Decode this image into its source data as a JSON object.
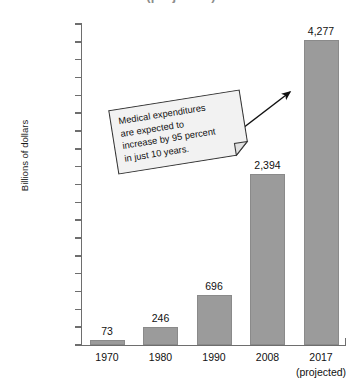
{
  "chart_data": {
    "type": "bar",
    "title": "(projected)",
    "xlabel": "",
    "ylabel": "Billions of dollars",
    "categories": [
      "1970",
      "1980",
      "1990",
      "2008",
      "2017"
    ],
    "category_sublabels": [
      "",
      "",
      "",
      "",
      "(projected)"
    ],
    "values": [
      73,
      246,
      696,
      2394,
      4277
    ],
    "value_labels": [
      "73",
      "246",
      "696",
      "2,394",
      "4,277"
    ],
    "ylim": [
      0,
      4500
    ],
    "ytick_step": 250,
    "ytick_labels": [
      "4,500",
      "4,250",
      "4,000",
      "3,750",
      "3,500",
      "3,250",
      "3,000",
      "2,750",
      "2,500",
      "2,250",
      "2,000",
      "1,750",
      "1,500",
      "1,250",
      "1,000",
      "750",
      "500",
      "250",
      "0"
    ],
    "ytick_values": [
      4500,
      4250,
      4000,
      3750,
      3500,
      3250,
      3000,
      2750,
      2500,
      2250,
      2000,
      1750,
      1500,
      1250,
      1000,
      750,
      500,
      250,
      0
    ],
    "grid": false,
    "legend": false,
    "bar_color": "#9b9b9b",
    "axis_color": "#6e6e6e",
    "text_color": "#111111",
    "title_color": "#8c8c8c"
  },
  "annotation": {
    "name": "callout-note",
    "lines": [
      "Medical expenditures",
      "are expected to",
      "increase by 95 percent",
      "in just 10 years."
    ],
    "text": "Medical expenditures are expected to increase by 95 percent in just 10 years.",
    "rotation_deg": -9,
    "fill": "#f2f2f2",
    "border": "#3a3a3a",
    "arrow_target_category": "2017"
  }
}
